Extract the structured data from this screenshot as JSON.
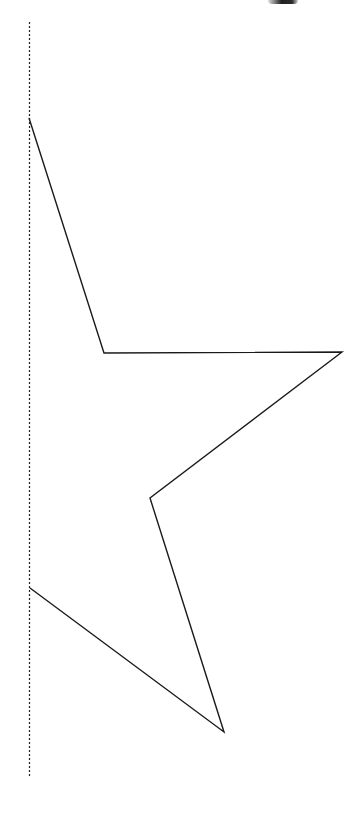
{
  "canvas": {
    "width": 364,
    "height": 825,
    "background": "#ffffff"
  },
  "mirror_axis": {
    "x": 29.5,
    "y1": 22,
    "y2": 778,
    "color": "#222222",
    "dash": "2,2"
  },
  "half_star": {
    "points": "29,118 104,353 342,352 150,498 224,732 30,588",
    "stroke": "#1a1a1a",
    "stroke_width": 1.4
  },
  "top_mark": {
    "color": "#1a1a1a"
  }
}
